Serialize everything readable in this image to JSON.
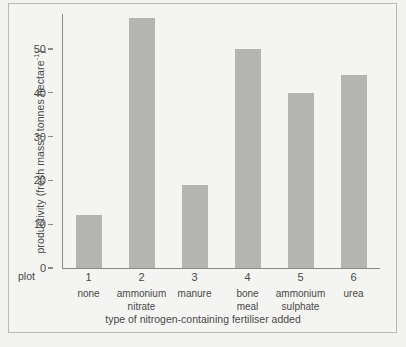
{
  "chart_data": {
    "type": "bar",
    "title": "",
    "subtitle": "",
    "xlabel": "type of nitrogen-containing fertiliser added",
    "ylabel": "productivity (fresh mass / tonnes hectare",
    "ylabel_exponent": "-1",
    "ylabel_tail": ")",
    "plot_row_label": "plot",
    "categories": [
      "none",
      "ammonium nitrate",
      "manure",
      "bone meal",
      "ammonium sulphate",
      "urea"
    ],
    "category_lines": [
      [
        "none"
      ],
      [
        "ammonium",
        "nitrate"
      ],
      [
        "manure"
      ],
      [
        "bone",
        "meal"
      ],
      [
        "ammonium",
        "sulphate"
      ],
      [
        "urea"
      ]
    ],
    "plot_numbers": [
      "1",
      "2",
      "3",
      "4",
      "5",
      "6"
    ],
    "values": [
      12,
      57,
      19,
      50,
      40,
      44
    ],
    "ylim": [
      0,
      57
    ],
    "yticks": [
      0,
      10,
      20,
      30,
      40,
      50
    ],
    "ytick_labels": [
      "0",
      "10",
      "20",
      "30",
      "40",
      "50"
    ],
    "grid": false,
    "legend": false,
    "bar_color": "#b4b4b2",
    "axis_color": "#8a8b87",
    "text_color": "#4a4a48",
    "background_color": "#f4f4f2"
  }
}
